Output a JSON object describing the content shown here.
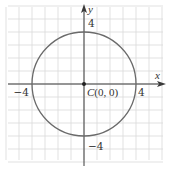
{
  "chart_data": {
    "type": "scatter",
    "title": "",
    "xlabel": "x",
    "ylabel": "y",
    "xlim": [
      -6,
      6
    ],
    "ylim": [
      -6,
      6
    ],
    "grid": true,
    "grid_step": 1,
    "x_tick_labels": [
      {
        "value": -4,
        "label": "−4"
      },
      {
        "value": 4,
        "label": "4"
      }
    ],
    "y_tick_labels": [
      {
        "value": 4,
        "label": "4"
      },
      {
        "value": -4,
        "label": "−4"
      }
    ],
    "circle": {
      "center": [
        0,
        0
      ],
      "radius": 4
    },
    "points": [
      {
        "x": 0,
        "y": 0,
        "label": "C(0, 0)",
        "name": "C"
      }
    ],
    "equation": "x^2 + y^2 = 16"
  },
  "labels": {
    "x_axis": "x",
    "y_axis": "y",
    "center_letter": "C",
    "center_coords": "(0, 0)",
    "x_neg": "−4",
    "x_pos": "4",
    "y_pos": "4",
    "y_neg": "−4"
  },
  "colors": {
    "grid": "#d9d9d9",
    "axis": "#3a3a3a",
    "curve": "#6a6a6a",
    "text": "#333333"
  }
}
